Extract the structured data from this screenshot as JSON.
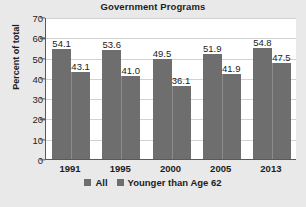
{
  "chart_data": {
    "type": "bar",
    "title": "Government Programs",
    "xlabel": "",
    "ylabel": "Percent of total",
    "categories": [
      "1991",
      "1995",
      "2000",
      "2005",
      "2013"
    ],
    "series": [
      {
        "name": "All",
        "values": [
          54.1,
          53.6,
          49.5,
          51.9,
          54.8
        ]
      },
      {
        "name": "Younger than Age 62",
        "values": [
          43.1,
          41.0,
          36.1,
          41.9,
          47.5
        ]
      }
    ],
    "labels": [
      [
        "54.1",
        "43.1"
      ],
      [
        "53.6",
        "41.0"
      ],
      [
        "49.5",
        "36.1"
      ],
      [
        "51.9",
        "41.9"
      ],
      [
        "54.8",
        "47.5"
      ]
    ],
    "ylim": [
      0,
      70
    ],
    "yticks": [
      "0",
      "10",
      "20",
      "30",
      "40",
      "50",
      "60",
      "70"
    ],
    "grid": true,
    "legend_position": "bottom",
    "bar_color": "#6e6e6e",
    "plot_background": "#ffffff",
    "figure_background": "#e9e9e9",
    "text_color": "#1c1c1c"
  },
  "footnote": {
    "text": ""
  }
}
